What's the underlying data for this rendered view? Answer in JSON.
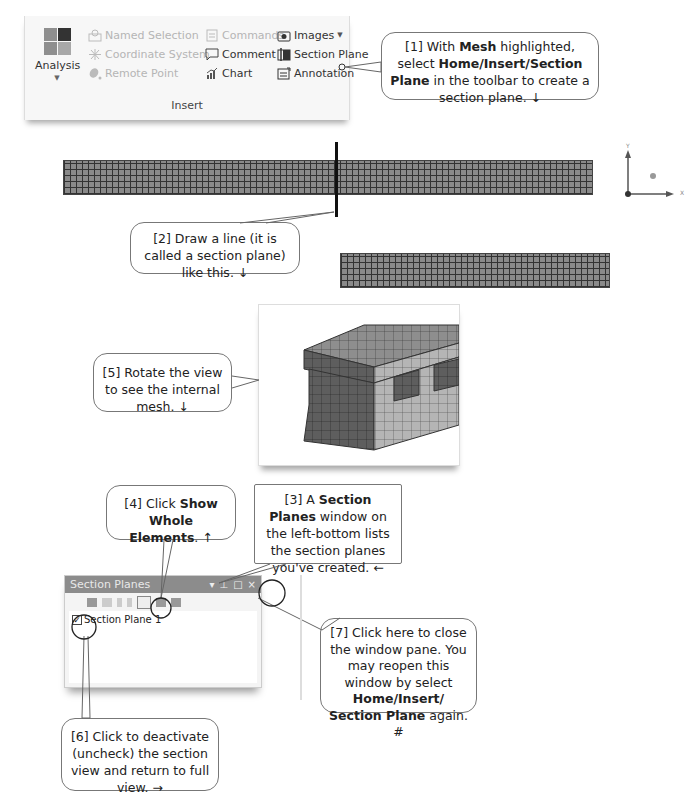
{
  "ribbon": {
    "analysis_label": "Analysis",
    "group_label": "Insert",
    "columns": [
      [
        {
          "label": "Named Selection",
          "icon": "named-selection-icon",
          "enabled": false
        },
        {
          "label": "Coordinate System",
          "icon": "coordinate-system-icon",
          "enabled": false
        },
        {
          "label": "Remote Point",
          "icon": "remote-point-icon",
          "enabled": false
        }
      ],
      [
        {
          "label": "Commands",
          "icon": "commands-icon",
          "enabled": false
        },
        {
          "label": "Comment",
          "icon": "comment-icon",
          "enabled": true
        },
        {
          "label": "Chart",
          "icon": "chart-icon",
          "enabled": true
        }
      ],
      [
        {
          "label": "Images",
          "icon": "images-icon",
          "enabled": true,
          "dropdown": true
        },
        {
          "label": "Section Plane",
          "icon": "section-plane-icon",
          "enabled": true
        },
        {
          "label": "Annotation",
          "icon": "annotation-icon",
          "enabled": true
        }
      ]
    ]
  },
  "callouts": {
    "c1": {
      "pre": "[1] With ",
      "b1": "Mesh",
      "mid": " highlighted, select ",
      "b2": "Home/Insert/Section Plane",
      "post": " in the toolbar to create a section plane. ↓"
    },
    "c2": {
      "text": "[2] Draw a line (it is called a section plane) like this. ↓"
    },
    "c3": {
      "pre": "[3] A ",
      "b1": "Section Planes",
      "post": " window on the left-bottom lists the section planes you've created. ←"
    },
    "c4": {
      "pre": "[4] Click ",
      "b1": "Show Whole Elements",
      "post": ". ↑"
    },
    "c5": {
      "text": "[5] Rotate the view to see the internal mesh. ↓"
    },
    "c6": {
      "text": "[6] Click to deactivate (uncheck) the section view and return to full view. →"
    },
    "c7": {
      "pre": "[7] Click here to close the window pane. You may reopen this window by select ",
      "b1": "Home/Insert/ Section Plane",
      "post": " again. #"
    }
  },
  "triad": {
    "y_label": "Y",
    "x_label": "X"
  },
  "section_pane": {
    "title": "Section Planes",
    "controls": [
      "▾",
      "⊥",
      "□",
      "×"
    ],
    "items": [
      {
        "label": "Section Plane 1",
        "checked": true
      }
    ]
  },
  "colors": {
    "mesh_fill": "#8a8a8a",
    "mesh_line": "#333333",
    "pane_title": "#8c8c8c"
  }
}
